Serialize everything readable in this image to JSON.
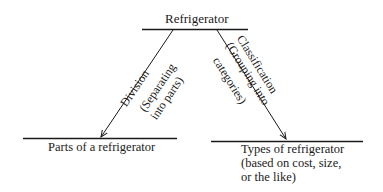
{
  "diagram": {
    "root": "Refrigerator",
    "left_branch": {
      "edge_label": "Division",
      "edge_sublabel_1": "(Separating",
      "edge_sublabel_2": "into parts)",
      "target": "Parts of a refrigerator"
    },
    "right_branch": {
      "edge_label": "Classification",
      "edge_sublabel_1": "(Grouping into",
      "edge_sublabel_2": "categories)",
      "target_line_1": "Types of refrigerator",
      "target_line_2": "(based on cost, size,",
      "target_line_3": "or the like)"
    }
  }
}
